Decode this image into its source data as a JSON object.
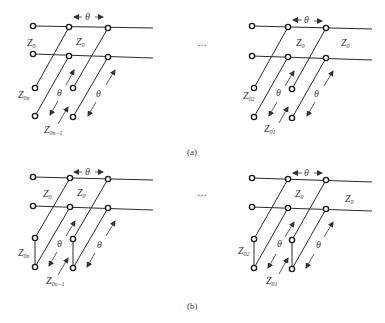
{
  "figure": {
    "panel_a": {
      "caption": "(a)",
      "left_network": {
        "theta_top": "θ",
        "z_line_left": "Z",
        "z_line_left_sub": "0",
        "z_line_right": "Z",
        "z_line_right_sub": "0",
        "stub_label_1": "Z",
        "stub_label_1_sub": "0n",
        "stub_label_2": "Z",
        "stub_label_2_sub": "0n−1",
        "theta_stub_1": "θ",
        "theta_stub_2": "θ"
      },
      "ellipsis": "…",
      "right_network": {
        "theta_top": "θ",
        "z_line_left": "Z",
        "z_line_left_sub": "0",
        "z_line_right": "Z",
        "z_line_right_sub": "0",
        "stub_label_1": "Z",
        "stub_label_1_sub": "02",
        "stub_label_2": "Z",
        "stub_label_2_sub": "01",
        "theta_stub_1": "θ",
        "theta_stub_2": "θ"
      },
      "stub_termination": "open"
    },
    "panel_b": {
      "caption": "(b)",
      "left_network": {
        "theta_top": "θ",
        "z_line_left": "Z",
        "z_line_left_sub": "0",
        "z_line_right": "Z",
        "z_line_right_sub": "0",
        "stub_label_1": "Z",
        "stub_label_1_sub": "0n",
        "stub_label_2": "Z",
        "stub_label_2_sub": "0n−1",
        "theta_stub_1": "θ",
        "theta_stub_2": "θ"
      },
      "ellipsis": "…",
      "right_network": {
        "theta_top": "θ",
        "z_line_left": "Z",
        "z_line_left_sub": "0",
        "z_line_right": "Z",
        "z_line_right_sub": "0",
        "stub_label_1": "Z",
        "stub_label_1_sub": "02",
        "stub_label_2": "Z",
        "stub_label_2_sub": "01",
        "theta_stub_1": "θ",
        "theta_stub_2": "θ"
      },
      "stub_termination": "shorted"
    }
  }
}
